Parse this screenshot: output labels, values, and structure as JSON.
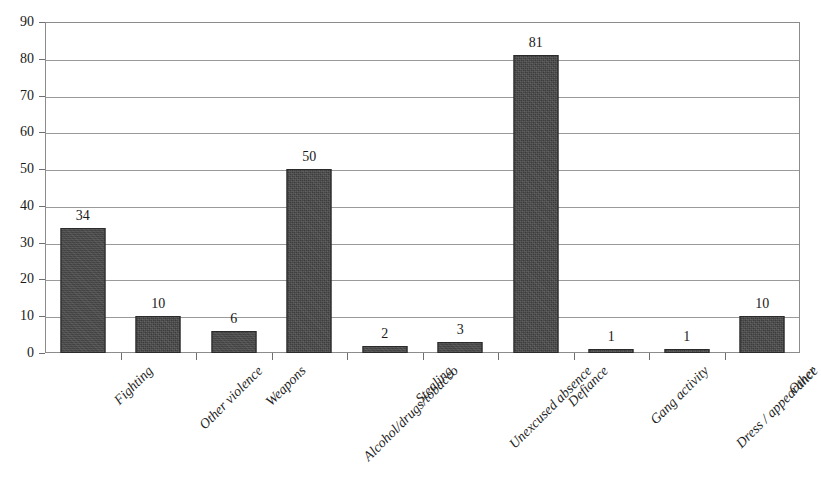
{
  "chart_data": {
    "type": "bar",
    "title": "",
    "xlabel": "",
    "ylabel": "",
    "ylim": [
      0,
      90
    ],
    "ytick_step": 10,
    "yticks": [
      90,
      80,
      70,
      60,
      50,
      40,
      30,
      20,
      10,
      0
    ],
    "grid": true,
    "legend": null,
    "bar_color": "#3c3c3c",
    "categories": [
      "Fighting",
      "Other violence",
      "Weapons",
      "Alcohol/drugs/tobacco",
      "Stealing",
      "Unexcused absence",
      "Defiance",
      "Gang activity",
      "Dress / appearance",
      "Other"
    ],
    "values": [
      34,
      10,
      6,
      50,
      2,
      3,
      81,
      1,
      1,
      10
    ],
    "data_labels": [
      "34",
      "10",
      "6",
      "50",
      "2",
      "3",
      "81",
      "1",
      "1",
      "10"
    ]
  }
}
